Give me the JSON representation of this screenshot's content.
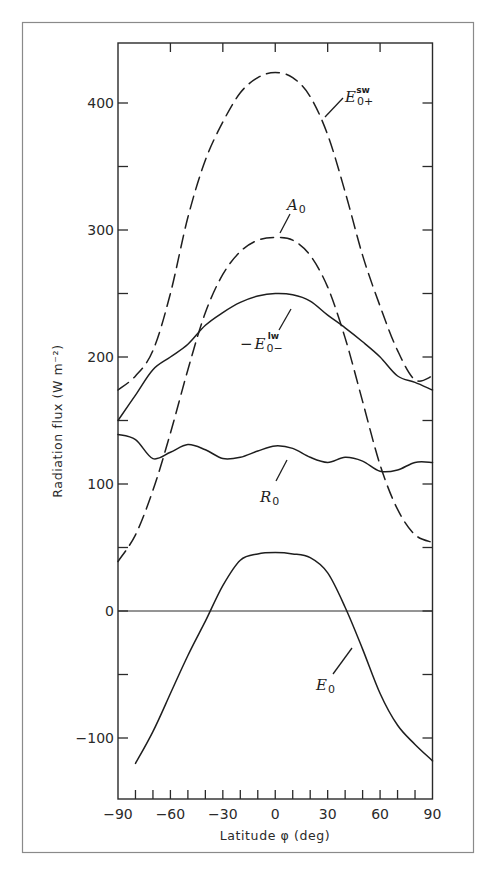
{
  "chart_data": {
    "type": "line",
    "title": "",
    "xlabel": "Latitude φ (deg)",
    "ylabel": "Radiation flux (W m⁻²)",
    "xlim": [
      -90,
      90
    ],
    "ylim": [
      -148,
      450
    ],
    "x_ticks": [
      -90,
      -60,
      -30,
      0,
      30,
      60,
      90
    ],
    "x_tick_labels": [
      "−90",
      "−60",
      "−30",
      "0",
      "30",
      "60",
      "90"
    ],
    "x_minor_step": 10,
    "y_ticks": [
      -100,
      0,
      100,
      200,
      300,
      400
    ],
    "y_tick_labels": [
      "−100",
      "0",
      "100",
      "200",
      "300",
      "400"
    ],
    "y_minor_step": 50,
    "grid": false,
    "zero_line": true,
    "legend": "inline labels",
    "series": [
      {
        "name": "E0+ sw",
        "label_main": "E",
        "label_sub": "0+",
        "label_sup": "sw",
        "label_prefix": "",
        "style": "dashed",
        "x": [
          -90,
          -80,
          -70,
          -60,
          -50,
          -40,
          -30,
          -20,
          -10,
          0,
          10,
          20,
          30,
          40,
          50,
          60,
          70,
          80,
          90
        ],
        "values": [
          174,
          185,
          205,
          250,
          310,
          355,
          385,
          408,
          420,
          424,
          420,
          405,
          375,
          330,
          280,
          240,
          205,
          182,
          185
        ]
      },
      {
        "name": "A0",
        "label_main": "A",
        "label_sub": "0",
        "label_sup": "",
        "label_prefix": "",
        "style": "dashed",
        "x": [
          -90,
          -80,
          -70,
          -60,
          -50,
          -40,
          -30,
          -20,
          -10,
          0,
          10,
          20,
          30,
          40,
          50,
          60,
          70,
          80,
          90
        ],
        "values": [
          39,
          60,
          95,
          140,
          190,
          235,
          265,
          283,
          292,
          294,
          292,
          280,
          255,
          215,
          165,
          115,
          80,
          60,
          54
        ]
      },
      {
        "name": "-E0- lw",
        "label_main": "E",
        "label_sub": "0−",
        "label_sup": "lw",
        "label_prefix": "−",
        "style": "solid",
        "x": [
          -90,
          -80,
          -70,
          -60,
          -50,
          -40,
          -30,
          -20,
          -10,
          0,
          10,
          20,
          30,
          40,
          50,
          60,
          70,
          80,
          90
        ],
        "values": [
          150,
          170,
          190,
          200,
          210,
          225,
          235,
          243,
          248,
          250,
          249,
          244,
          233,
          223,
          212,
          200,
          185,
          180,
          174
        ]
      },
      {
        "name": "R0",
        "label_main": "R",
        "label_sub": "0",
        "label_sup": "",
        "label_prefix": "",
        "style": "solid",
        "x": [
          -90,
          -80,
          -70,
          -60,
          -50,
          -40,
          -30,
          -20,
          -10,
          0,
          10,
          20,
          30,
          40,
          50,
          60,
          70,
          80,
          90
        ],
        "values": [
          139,
          135,
          120,
          125,
          131,
          127,
          120,
          121,
          126,
          130,
          128,
          121,
          117,
          121,
          118,
          110,
          111,
          117,
          117
        ]
      },
      {
        "name": "E0",
        "label_main": "E",
        "label_sub": "0",
        "label_sup": "",
        "label_prefix": "",
        "style": "solid",
        "x": [
          -80,
          -70,
          -60,
          -50,
          -40,
          -30,
          -20,
          -10,
          0,
          10,
          20,
          30,
          40,
          50,
          60,
          70,
          80,
          90
        ],
        "values": [
          -120,
          -95,
          -65,
          -35,
          -8,
          20,
          40,
          45,
          46,
          45,
          42,
          30,
          3,
          -30,
          -65,
          -90,
          -105,
          -118
        ]
      }
    ]
  },
  "labels": {
    "x_axis": "Latitude φ (deg)",
    "y_axis": "Radiation flux (W m⁻²)"
  }
}
